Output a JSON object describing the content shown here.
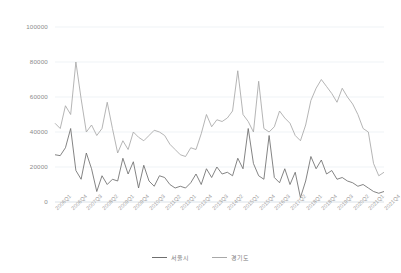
{
  "chart_data": {
    "type": "line",
    "title": "",
    "xlabel": "",
    "ylabel": "",
    "ylim": [
      0,
      100000
    ],
    "yticks": [
      0,
      20000,
      40000,
      60000,
      80000,
      100000
    ],
    "ytick_labels": [
      "0",
      "20000",
      "40000",
      "60000",
      "80000",
      "100000"
    ],
    "grid": true,
    "legend_position": "bottom-center",
    "x": [
      "2006Q1",
      "2006Q2",
      "2006Q3",
      "2006Q4",
      "2007Q1",
      "2007Q2",
      "2007Q3",
      "2007Q4",
      "2008Q1",
      "2008Q2",
      "2008Q3",
      "2008Q4",
      "2009Q1",
      "2009Q2",
      "2009Q3",
      "2009Q4",
      "2010Q1",
      "2010Q2",
      "2010Q3",
      "2010Q4",
      "2011Q1",
      "2011Q2",
      "2011Q3",
      "2011Q4",
      "2012Q1",
      "2012Q2",
      "2012Q3",
      "2012Q4",
      "2013Q1",
      "2013Q2",
      "2013Q3",
      "2013Q4",
      "2014Q1",
      "2014Q2",
      "2014Q3",
      "2014Q4",
      "2015Q1",
      "2015Q2",
      "2015Q3",
      "2015Q4",
      "2016Q1",
      "2016Q2",
      "2016Q3",
      "2016Q4",
      "2017Q1",
      "2017Q2",
      "2017Q3",
      "2017Q4",
      "2018Q1",
      "2018Q2",
      "2018Q3",
      "2018Q4",
      "2019Q1",
      "2019Q2",
      "2019Q3",
      "2019Q4",
      "2020Q1",
      "2020Q2",
      "2020Q3",
      "2020Q4",
      "2021Q1",
      "2021Q2",
      "2021Q3",
      "2021Q4"
    ],
    "xtick_labels": [
      "2006Q1",
      "2006Q4",
      "2007Q3",
      "2008Q2",
      "2009Q1",
      "2009Q4",
      "2010Q3",
      "2011Q2",
      "2012Q1",
      "2012Q4",
      "2013Q3",
      "2014Q2",
      "2015Q1",
      "2015Q4",
      "2016Q3",
      "2017Q2",
      "2018Q1",
      "2018Q4",
      "2019Q3",
      "2020Q2",
      "2021Q1",
      "2021Q4"
    ],
    "xtick_indices": [
      0,
      3,
      6,
      9,
      12,
      15,
      18,
      21,
      24,
      27,
      30,
      33,
      36,
      39,
      42,
      45,
      48,
      51,
      54,
      57,
      60,
      63
    ],
    "series": [
      {
        "name": "서울시",
        "color": "#6e6e6e",
        "values": [
          27000,
          26500,
          31000,
          42000,
          18000,
          13000,
          28000,
          19000,
          6000,
          15000,
          10000,
          13000,
          12000,
          25000,
          16000,
          23000,
          8000,
          21000,
          12000,
          9000,
          15000,
          14000,
          10000,
          8000,
          9000,
          8000,
          11000,
          16000,
          10000,
          19000,
          14000,
          20000,
          16000,
          17000,
          15000,
          25000,
          19000,
          42000,
          22000,
          15000,
          13000,
          38000,
          14000,
          11000,
          19000,
          10000,
          17000,
          2500,
          12000,
          26000,
          19000,
          24000,
          16000,
          18000,
          13000,
          14000,
          12000,
          11000,
          9000,
          10000,
          8000,
          6000,
          5000,
          6000
        ]
      },
      {
        "name": "경기도",
        "color": "#a8a8a8",
        "values": [
          45000,
          42000,
          55000,
          50000,
          80000,
          59000,
          40000,
          44000,
          38000,
          42000,
          57000,
          42000,
          28000,
          35000,
          30000,
          40000,
          37000,
          35000,
          38000,
          41000,
          40000,
          38000,
          33000,
          30000,
          27000,
          26000,
          31000,
          30000,
          39000,
          50000,
          43000,
          47000,
          46000,
          48000,
          52000,
          75000,
          50000,
          46000,
          40000,
          69000,
          42000,
          40000,
          43000,
          52000,
          48000,
          45000,
          38000,
          35000,
          44000,
          58000,
          65000,
          70000,
          66000,
          62000,
          57000,
          65000,
          60000,
          56000,
          50000,
          42000,
          40000,
          22000,
          15000,
          17000
        ]
      }
    ]
  },
  "legend": {
    "items": [
      {
        "label": "서울시",
        "color": "#6e6e6e"
      },
      {
        "label": "경기도",
        "color": "#a8a8a8"
      }
    ]
  },
  "axis_colors": {
    "grid": "#e8eef2",
    "tick_text": "#9a9a9a",
    "background": "#ffffff"
  }
}
